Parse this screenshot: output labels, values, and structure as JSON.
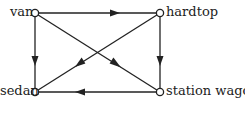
{
  "diagram": {
    "type": "directed-graph",
    "nodes": [
      {
        "id": "van",
        "label": "van",
        "x": 35,
        "y": 13
      },
      {
        "id": "hardtop",
        "label": "hardtop",
        "x": 160,
        "y": 13
      },
      {
        "id": "sedan",
        "label": "sedan",
        "x": 35,
        "y": 92
      },
      {
        "id": "station_wagon",
        "label": "station wagon",
        "x": 160,
        "y": 92
      }
    ],
    "edges": [
      {
        "from": "van",
        "to": "hardtop"
      },
      {
        "from": "van",
        "to": "sedan"
      },
      {
        "from": "van",
        "to": "station_wagon"
      },
      {
        "from": "hardtop",
        "to": "station_wagon"
      },
      {
        "from": "hardtop",
        "to": "sedan"
      },
      {
        "from": "station_wagon",
        "to": "sedan"
      }
    ],
    "colors": {
      "line": "#222222",
      "node_fill": "#ffffff"
    }
  }
}
